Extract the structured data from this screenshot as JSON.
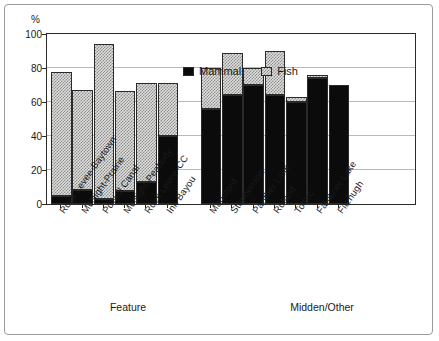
{
  "chart_data": {
    "type": "bar",
    "stacked": true,
    "title": "",
    "xlabel": "",
    "ylabel": "%",
    "ylim": [
      0,
      100
    ],
    "yticks": [
      0,
      20,
      40,
      60,
      80,
      100
    ],
    "grid": true,
    "legend_position": "top-center-inside",
    "legend": [
      "Mammal",
      "Fish"
    ],
    "series": [
      {
        "name": "Mammal",
        "color": "#0b0b0b",
        "values": [
          5,
          8,
          3,
          7.5,
          13,
          40,
          56,
          64,
          70,
          64,
          60,
          74,
          70
        ]
      },
      {
        "name": "Fish",
        "color": "#dededc",
        "values": [
          72.5,
          59,
          91,
          59,
          58,
          31,
          24,
          25,
          10,
          26,
          3,
          2,
          0
        ]
      }
    ],
    "totals": [
      77.5,
      67,
      94,
      66.5,
      71,
      71,
      80,
      89,
      80,
      90,
      63,
      76,
      70
    ],
    "categories": [
      "Rock Levee-Baytown",
      "McNight-Prairie",
      "Powell Canal",
      "McNight-Peabody",
      "Rock Levee-CC",
      "Ink Bayou",
      "Mansford",
      "Stephenson",
      "Panther Lake",
      "Roland",
      "Toltec",
      "Faulkner Lake",
      "Fitzhugh"
    ],
    "groups": [
      {
        "label": "Feature",
        "categories": [
          0,
          1,
          2,
          3,
          4,
          5
        ]
      },
      {
        "label": "Midden/Other",
        "categories": [
          6,
          7,
          8,
          9,
          10,
          11,
          12
        ]
      }
    ]
  },
  "axis": {
    "y_unit_label": "%",
    "y_tick_labels": [
      "100",
      "80",
      "60",
      "40",
      "20",
      "0"
    ]
  }
}
